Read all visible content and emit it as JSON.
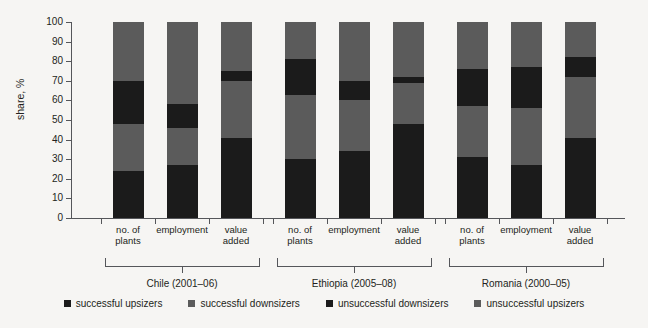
{
  "chart_data": {
    "type": "bar",
    "subtype": "stacked-100-percent",
    "title": "",
    "xlabel": "",
    "ylabel": "share, %",
    "ylim": [
      0,
      100
    ],
    "yticks": [
      0,
      10,
      20,
      30,
      40,
      50,
      60,
      70,
      80,
      90,
      100
    ],
    "grid": false,
    "legend_position": "bottom",
    "categories": [
      "no. of plants",
      "employment",
      "value added",
      "no. of plants",
      "employment",
      "value added",
      "no. of plants",
      "employment",
      "value added"
    ],
    "groups": [
      {
        "label": "Chile (2001–06)",
        "categories": [
          "no. of plants",
          "employment",
          "value added"
        ]
      },
      {
        "label": "Ethiopia (2005–08)",
        "categories": [
          "no. of plants",
          "employment",
          "value added"
        ]
      },
      {
        "label": "Romania (2000–05)",
        "categories": [
          "no. of plants",
          "employment",
          "value added"
        ]
      }
    ],
    "series": [
      {
        "name": "successful upsizers",
        "color": "#1b1b1b",
        "values": [
          24,
          27,
          41,
          30,
          34,
          48,
          31,
          27,
          41
        ]
      },
      {
        "name": "successful downsizers",
        "color": "#5b5b5b",
        "values": [
          24,
          19,
          29,
          33,
          26,
          21,
          26,
          29,
          31
        ]
      },
      {
        "name": "unsuccessful downsizers",
        "color": "#1b1b1b",
        "values": [
          22,
          12,
          5,
          18,
          10,
          3,
          19,
          21,
          10
        ]
      },
      {
        "name": "unsuccessful upsizers",
        "color": "#5b5b5b",
        "values": [
          30,
          42,
          25,
          19,
          30,
          28,
          24,
          23,
          18
        ]
      }
    ]
  },
  "legend": {
    "items": [
      {
        "label": "successful upsizers",
        "color": "#1b1b1b"
      },
      {
        "label": "successful downsizers",
        "color": "#5b5b5b"
      },
      {
        "label": "unsuccessful downsizers",
        "color": "#1b1b1b"
      },
      {
        "label": "unsuccessful upsizers",
        "color": "#5b5b5b"
      }
    ]
  },
  "colors": {
    "background": "#f6f5f3",
    "axis": "#55565a",
    "text": "#231f20",
    "dark": "#1b1b1b",
    "gray": "#5b5b5b"
  }
}
